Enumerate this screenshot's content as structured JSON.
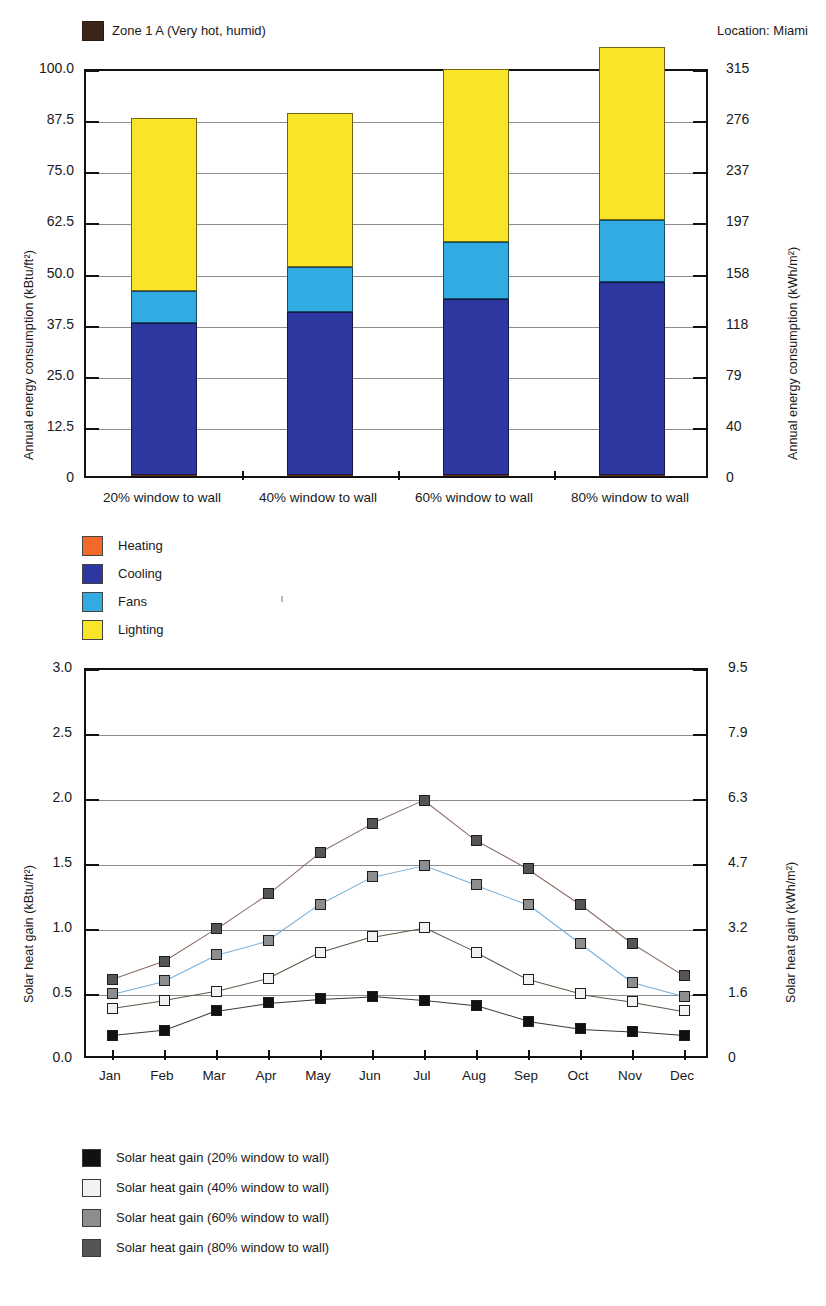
{
  "chart_data": [
    {
      "type": "bar",
      "stacked": true,
      "title": "Zone 1 A (Very hot, humid)",
      "annotation": "Location: Miami",
      "xlabel": "",
      "ylabel": "Annual energy consumption (kBtu/ft²)",
      "ylabel_right": "Annual energy consumption (kWh/m²)",
      "categories": [
        "20% window to wall",
        "40% window to wall",
        "60% window to wall",
        "80% window to wall"
      ],
      "ylim": [
        0,
        100
      ],
      "yticks": [
        "0",
        "12.5",
        "25.0",
        "37.5",
        "50.0",
        "62.5",
        "75.0",
        "87.5",
        "100.0"
      ],
      "ytick_values": [
        0,
        12.5,
        25,
        37.5,
        50,
        62.5,
        75,
        87.5,
        100
      ],
      "yticks_right": [
        "0",
        "40",
        "79",
        "118",
        "158",
        "197",
        "237",
        "276",
        "315"
      ],
      "ylim_right": [
        0,
        315
      ],
      "grid": true,
      "legend_position": "below",
      "series": [
        {
          "name": "Heating",
          "color": "#f4682a",
          "values": [
            0.3,
            0.3,
            0.3,
            0.3
          ]
        },
        {
          "name": "Cooling",
          "color": "#2e36a0",
          "values": [
            37.0,
            39.9,
            43.1,
            47.1
          ]
        },
        {
          "name": "Fans",
          "color": "#32abe2",
          "values": [
            8.0,
            11.0,
            13.7,
            15.2
          ]
        },
        {
          "name": "Lighting",
          "color": "#f8e52a",
          "values": [
            42.2,
            37.6,
            42.5,
            42.4
          ]
        }
      ],
      "totals": [
        87.5,
        88.8,
        99.6,
        105.0
      ]
    },
    {
      "type": "line",
      "title": "",
      "xlabel": "",
      "ylabel": "Solar heat gain (kBtu/ft²)",
      "ylabel_right": "Solar heat gain (kWh/m²)",
      "x": [
        "Jan",
        "Feb",
        "Mar",
        "Apr",
        "May",
        "Jun",
        "Jul",
        "Aug",
        "Sep",
        "Oct",
        "Nov",
        "Dec"
      ],
      "ylim": [
        0,
        3.0
      ],
      "yticks": [
        "0.0",
        "0.5",
        "1.0",
        "1.5",
        "2.0",
        "2.5",
        "3.0"
      ],
      "ytick_values": [
        0,
        0.5,
        1.0,
        1.5,
        2.0,
        2.5,
        3.0
      ],
      "yticks_right": [
        "0",
        "1.6",
        "3.2",
        "4.7",
        "6.3",
        "7.9",
        "9.5"
      ],
      "ylim_right": [
        0,
        9.5
      ],
      "grid": true,
      "legend_position": "below",
      "series": [
        {
          "name": "Solar heat gain (20% window to wall)",
          "color": "#111111",
          "line": "#3a3a3a",
          "values": [
            0.19,
            0.23,
            0.38,
            0.44,
            0.47,
            0.49,
            0.46,
            0.42,
            0.3,
            0.24,
            0.22,
            0.19
          ]
        },
        {
          "name": "Solar heat gain (40% window to wall)",
          "color": "#f2f2f2",
          "line": "#5a5a48",
          "values": [
            0.4,
            0.46,
            0.53,
            0.63,
            0.83,
            0.95,
            1.02,
            0.83,
            0.62,
            0.51,
            0.45,
            0.38
          ]
        },
        {
          "name": "Solar heat gain (60% window to wall)",
          "color": "#8d8d8d",
          "line": "#7aaed6",
          "values": [
            0.51,
            0.61,
            0.81,
            0.92,
            1.2,
            1.41,
            1.5,
            1.35,
            1.2,
            0.9,
            0.6,
            0.49
          ]
        },
        {
          "name": "Solar heat gain (80% window to wall)",
          "color": "#555555",
          "line": "#8a6a63",
          "values": [
            0.62,
            0.76,
            1.01,
            1.28,
            1.6,
            1.82,
            2.0,
            1.69,
            1.47,
            1.2,
            0.9,
            0.65
          ]
        }
      ]
    }
  ],
  "chart1": {
    "header_label": "Zone 1 A (Very hot, humid)",
    "location_label": "Location: Miami",
    "ylabel_left": "Annual energy consumption (kBtu/ft²)",
    "ylabel_right": "Annual energy consumption (kWh/m²)",
    "legend": [
      {
        "label": "Heating"
      },
      {
        "label": "Cooling"
      },
      {
        "label": "Fans"
      },
      {
        "label": "Lighting"
      }
    ]
  },
  "chart2": {
    "ylabel_left": "Solar heat gain (kBtu/ft²)",
    "ylabel_right": "Solar heat gain (kWh/m²)",
    "legend": [
      {
        "label": "Solar heat gain (20% window to wall)"
      },
      {
        "label": "Solar heat gain (40% window to wall)"
      },
      {
        "label": "Solar heat gain (60% window to wall)"
      },
      {
        "label": "Solar heat gain (80% window to wall)"
      }
    ]
  },
  "colors": {
    "heating": "#f4682a",
    "cooling": "#2e36a0",
    "fans": "#32abe2",
    "lighting": "#f8e52a",
    "zone_swatch": "#3b2418"
  }
}
